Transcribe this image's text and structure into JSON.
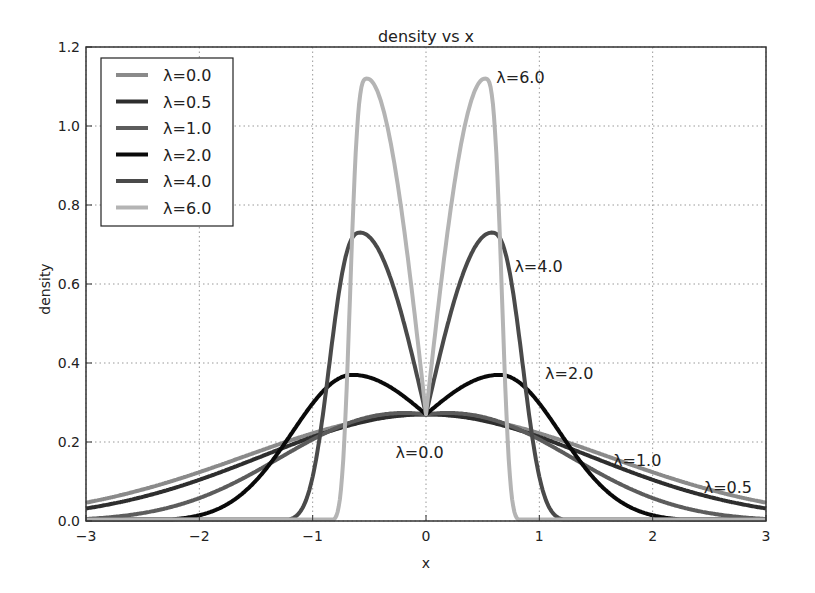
{
  "chart_data": {
    "type": "line",
    "title": "density vs x",
    "xlabel": "x",
    "ylabel": "density",
    "xlim": [
      -3,
      3
    ],
    "ylim": [
      0.0,
      1.2
    ],
    "xticks": [
      -3,
      -2,
      -1,
      0,
      1,
      2,
      3
    ],
    "xtick_labels": [
      "−3",
      "−2",
      "−1",
      "0",
      "1",
      "2",
      "3"
    ],
    "yticks": [
      0.0,
      0.2,
      0.4,
      0.6,
      0.8,
      1.0,
      1.2
    ],
    "ytick_labels": [
      "0.0",
      "0.2",
      "0.4",
      "0.6",
      "0.8",
      "1.0",
      "1.2"
    ],
    "grid": true,
    "legend_position": "upper left",
    "formula": "density(x) = C(λ) * exp(-x^2/2) * |x|^λ ... (peaks symmetric about 0, all curves meet at x=0, density≈0.27)",
    "series": [
      {
        "name": "λ=0.0",
        "lambda": 0.0,
        "color": "#8a8a8a",
        "peak_x": 0.0,
        "peak_y": 0.27,
        "points": [
          [
            -3,
            0.04
          ],
          [
            -2,
            0.09
          ],
          [
            -1,
            0.19
          ],
          [
            0,
            0.27
          ],
          [
            1,
            0.19
          ],
          [
            2,
            0.09
          ],
          [
            3,
            0.04
          ]
        ]
      },
      {
        "name": "λ=0.5",
        "lambda": 0.5,
        "color": "#2e2e2e",
        "peak_x": 0.0,
        "peak_y": 0.27,
        "points": [
          [
            -3,
            0.05
          ],
          [
            -2,
            0.11
          ],
          [
            -1,
            0.21
          ],
          [
            0,
            0.27
          ],
          [
            1,
            0.21
          ],
          [
            2,
            0.11
          ],
          [
            3,
            0.05
          ]
        ]
      },
      {
        "name": "λ=1.0",
        "lambda": 1.0,
        "color": "#5c5c5c",
        "peak_x": 0.0,
        "peak_y": 0.27,
        "points": [
          [
            -3,
            0.06
          ],
          [
            -2,
            0.12
          ],
          [
            -1,
            0.23
          ],
          [
            0,
            0.27
          ],
          [
            1,
            0.23
          ],
          [
            2,
            0.12
          ],
          [
            3,
            0.06
          ]
        ]
      },
      {
        "name": "λ=2.0",
        "lambda": 2.0,
        "color": "#0a0a0a",
        "peak_x": 0.65,
        "peak_y": 0.37,
        "points": [
          [
            -3,
            0.0
          ],
          [
            -2,
            0.01
          ],
          [
            -1,
            0.27
          ],
          [
            -0.65,
            0.37
          ],
          [
            0,
            0.27
          ],
          [
            0.65,
            0.37
          ],
          [
            1,
            0.27
          ],
          [
            2,
            0.01
          ],
          [
            3,
            0.0
          ]
        ]
      },
      {
        "name": "λ=4.0",
        "lambda": 4.0,
        "color": "#4a4a4a",
        "peak_x": 0.58,
        "peak_y": 0.73,
        "points": [
          [
            -3,
            0.0
          ],
          [
            -1.1,
            0.0
          ],
          [
            -0.58,
            0.73
          ],
          [
            0,
            0.27
          ],
          [
            0.58,
            0.73
          ],
          [
            1.1,
            0.0
          ],
          [
            3,
            0.0
          ]
        ]
      },
      {
        "name": "λ=6.0",
        "lambda": 6.0,
        "color": "#b4b4b4",
        "peak_x": 0.52,
        "peak_y": 1.12,
        "points": [
          [
            -3,
            0.0
          ],
          [
            -0.8,
            0.0
          ],
          [
            -0.52,
            1.12
          ],
          [
            0,
            0.27
          ],
          [
            0.52,
            1.12
          ],
          [
            0.8,
            0.0
          ],
          [
            3,
            0.0
          ]
        ]
      }
    ],
    "annotations": [
      {
        "text": "λ=6.0",
        "x": 0.62,
        "y": 1.11
      },
      {
        "text": "λ=4.0",
        "x": 0.78,
        "y": 0.63
      },
      {
        "text": "λ=2.0",
        "x": 1.05,
        "y": 0.36
      },
      {
        "text": "λ=0.0",
        "x": -0.27,
        "y": 0.16
      },
      {
        "text": "λ=1.0",
        "x": 1.65,
        "y": 0.14
      },
      {
        "text": "λ=0.5",
        "x": 2.45,
        "y": 0.07
      }
    ]
  }
}
